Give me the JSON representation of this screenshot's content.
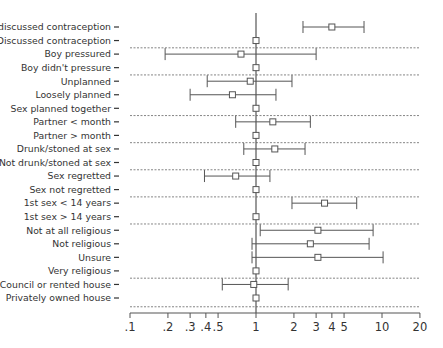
{
  "chart_data": {
    "type": "forest",
    "title": "",
    "xlabel": "",
    "ylabel": "",
    "x_scale": "log",
    "xlim": [
      0.1,
      20
    ],
    "x_ticks": [
      ".1",
      ".2",
      ".3",
      ".4",
      ".5",
      "1",
      "2",
      "3",
      "4",
      "5",
      "10",
      "20"
    ],
    "x_tick_values": [
      0.1,
      0.2,
      0.3,
      0.4,
      0.5,
      1,
      2,
      3,
      4,
      5,
      10,
      20
    ],
    "reference_line": 1,
    "grid": false,
    "legend": null,
    "groups": [
      {
        "rows": [
          {
            "label": "Not discussed contraception",
            "estimate": 4.0,
            "ci_low": 2.36,
            "ci_high": 7.2
          },
          {
            "label": "Discussed contraception",
            "estimate": 1,
            "reference": true
          }
        ]
      },
      {
        "rows": [
          {
            "label": "Boy pressured",
            "estimate": 0.76,
            "ci_low": 0.19,
            "ci_high": 3.0
          },
          {
            "label": "Boy didn't pressure",
            "estimate": 1,
            "reference": true
          }
        ]
      },
      {
        "rows": [
          {
            "label": "Unplanned",
            "estimate": 0.9,
            "ci_low": 0.41,
            "ci_high": 1.93
          },
          {
            "label": "Loosely planned",
            "estimate": 0.65,
            "ci_low": 0.3,
            "ci_high": 1.44
          },
          {
            "label": "Sex planned together",
            "estimate": 1,
            "reference": true
          }
        ]
      },
      {
        "rows": [
          {
            "label": "Partner < month",
            "estimate": 1.36,
            "ci_low": 0.69,
            "ci_high": 2.7
          },
          {
            "label": "Partner > month",
            "estimate": 1,
            "reference": true
          }
        ]
      },
      {
        "rows": [
          {
            "label": "Drunk/stoned at sex",
            "estimate": 1.41,
            "ci_low": 0.8,
            "ci_high": 2.45
          },
          {
            "label": "Not drunk/stoned at sex",
            "estimate": 1,
            "reference": true
          }
        ]
      },
      {
        "rows": [
          {
            "label": "Sex regretted",
            "estimate": 0.69,
            "ci_low": 0.39,
            "ci_high": 1.29
          },
          {
            "label": "Sex not regretted",
            "estimate": 1,
            "reference": true
          }
        ]
      },
      {
        "rows": [
          {
            "label": "1st sex < 14 years",
            "estimate": 3.5,
            "ci_low": 1.93,
            "ci_high": 6.3
          },
          {
            "label": "1st sex > 14 years",
            "estimate": 1,
            "reference": true
          }
        ]
      },
      {
        "rows": [
          {
            "label": "Not at all religious",
            "estimate": 3.1,
            "ci_low": 1.08,
            "ci_high": 8.5
          },
          {
            "label": "Not religious",
            "estimate": 2.7,
            "ci_low": 0.93,
            "ci_high": 7.9
          },
          {
            "label": "Unsure",
            "estimate": 3.1,
            "ci_low": 0.93,
            "ci_high": 10.2
          },
          {
            "label": "Very religious",
            "estimate": 1,
            "reference": true
          }
        ]
      },
      {
        "rows": [
          {
            "label": "Council or rented house",
            "estimate": 0.96,
            "ci_low": 0.54,
            "ci_high": 1.8
          },
          {
            "label": "Privately owned house",
            "estimate": 1,
            "reference": true
          }
        ]
      }
    ]
  },
  "colors": {
    "line": "#555555",
    "text": "#333333",
    "dashed": "#666666",
    "background": "#ffffff"
  }
}
